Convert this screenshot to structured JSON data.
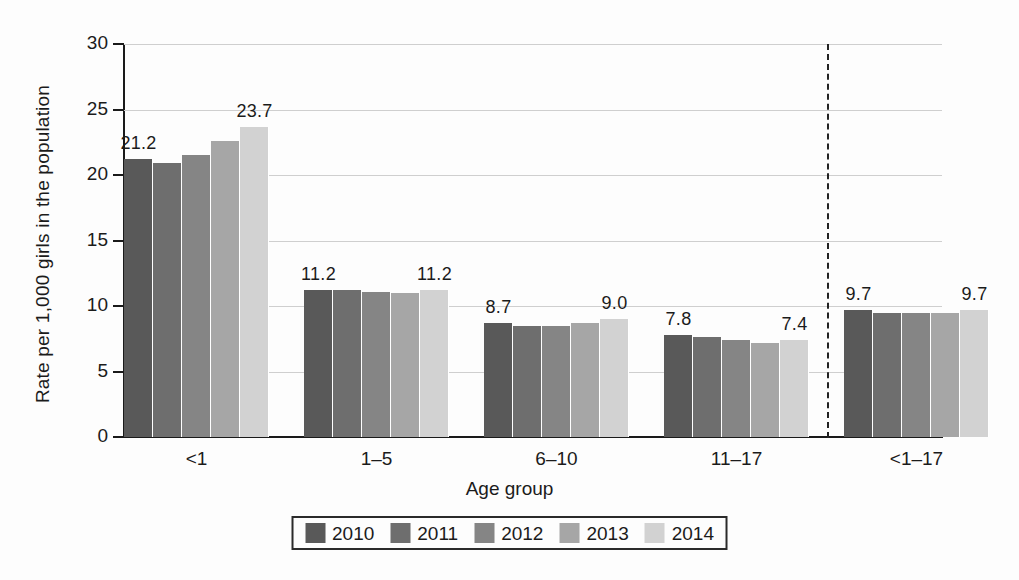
{
  "chart_data": {
    "type": "bar",
    "title": "",
    "xlabel": "Age group",
    "ylabel": "Rate per 1,000 girls in the population",
    "ylim": [
      0,
      30
    ],
    "yticks": [
      0,
      5,
      10,
      15,
      20,
      25,
      30
    ],
    "grid": true,
    "legend_position": "bottom",
    "categories": [
      "<1",
      "1–5",
      "6–10",
      "11–17",
      "<1–17"
    ],
    "series": [
      {
        "name": "2010",
        "color": "#595959",
        "values": [
          21.2,
          11.2,
          8.7,
          7.8,
          9.7
        ]
      },
      {
        "name": "2011",
        "color": "#6e6e6e",
        "values": [
          20.9,
          11.2,
          8.5,
          7.6,
          9.5
        ]
      },
      {
        "name": "2012",
        "color": "#858585",
        "values": [
          21.5,
          11.1,
          8.5,
          7.4,
          9.5
        ]
      },
      {
        "name": "2013",
        "color": "#a6a6a6",
        "values": [
          22.6,
          11.0,
          8.7,
          7.2,
          9.5
        ]
      },
      {
        "name": "2014",
        "color": "#d2d2d2",
        "values": [
          23.7,
          11.2,
          9.0,
          7.4,
          9.7
        ]
      }
    ],
    "annotations": [
      {
        "group": "<1",
        "series": "2010",
        "text": "21.2"
      },
      {
        "group": "<1",
        "series": "2014",
        "text": "23.7"
      },
      {
        "group": "1–5",
        "series": "2010",
        "text": "11.2"
      },
      {
        "group": "1–5",
        "series": "2014",
        "text": "11.2"
      },
      {
        "group": "6–10",
        "series": "2010",
        "text": "8.7"
      },
      {
        "group": "6–10",
        "series": "2014",
        "text": "9.0"
      },
      {
        "group": "11–17",
        "series": "2010",
        "text": "7.8"
      },
      {
        "group": "11–17",
        "series": "2014",
        "text": "7.4"
      },
      {
        "group": "<1–17",
        "series": "2010",
        "text": "9.7"
      },
      {
        "group": "<1–17",
        "series": "2014",
        "text": "9.7"
      }
    ],
    "divider_after_category": "11–17"
  },
  "axis": {
    "y_title": "Rate per 1,000 girls in the population",
    "x_title": "Age group",
    "y_tick_labels": [
      "30",
      "25",
      "20",
      "15",
      "10",
      "5",
      "0"
    ],
    "x_tick_labels": [
      "<1",
      "1–5",
      "6–10",
      "11–17",
      "<1–17"
    ]
  },
  "legend": {
    "items": [
      {
        "label": "2010",
        "color": "#595959"
      },
      {
        "label": "2011",
        "color": "#6e6e6e"
      },
      {
        "label": "2012",
        "color": "#858585"
      },
      {
        "label": "2013",
        "color": "#a6a6a6"
      },
      {
        "label": "2014",
        "color": "#d2d2d2"
      }
    ]
  },
  "labels": {
    "g1_first": "21.2",
    "g1_last": "23.7",
    "g2_first": "11.2",
    "g2_last": "11.2",
    "g3_first": "8.7",
    "g3_last": "9.0",
    "g4_first": "7.8",
    "g4_last": "7.4",
    "g5_first": "9.7",
    "g5_last": "9.7"
  }
}
